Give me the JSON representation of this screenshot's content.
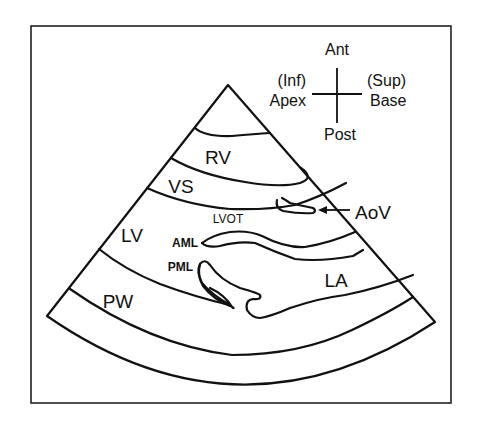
{
  "diagram": {
    "orientation": {
      "top": "Ant",
      "bottom": "Post",
      "left_line1": "(Inf)",
      "left_line2": "Apex",
      "right_line1": "(Sup)",
      "right_line2": "Base"
    },
    "structures": {
      "rv": "RV",
      "vs": "VS",
      "lv": "LV",
      "lvot": "LVOT",
      "aml": "AML",
      "pml": "PML",
      "aov": "AoV",
      "la": "LA",
      "pw": "PW"
    },
    "colors": {
      "line": "#111111",
      "background": "#ffffff"
    }
  }
}
